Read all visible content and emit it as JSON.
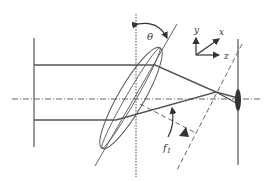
{
  "diagram": {
    "type": "optical-schematic",
    "labels": {
      "theta": "θ",
      "f1_main": "f",
      "f1_sub": "1",
      "axis_x": "x",
      "axis_y": "y",
      "axis_z": "z"
    },
    "colors": {
      "line": "#555555",
      "dark": "#333333",
      "background": "#ffffff"
    },
    "elements": [
      "left-aperture-plane",
      "incident-beam-top",
      "incident-beam-bottom",
      "optical-axis",
      "vertical-reference-line",
      "tilted-lens",
      "lens-tilt-axis",
      "converging-rays",
      "detector-plane",
      "detector-spot",
      "focal-plane-dashed",
      "tilt-angle-theta",
      "focal-length-f1",
      "coordinate-axes"
    ]
  }
}
